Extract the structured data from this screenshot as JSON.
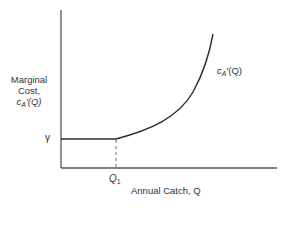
{
  "diagram": {
    "type": "marginal-cost-curve",
    "y_axis": {
      "label_line1": "Marginal",
      "label_line2": "Cost,",
      "label_fn": "c",
      "label_sub": "A",
      "label_rest": "'(Q)"
    },
    "x_axis": {
      "label": "Annual Catch, Q"
    },
    "gamma_label": "γ",
    "q1_label": "Q",
    "q1_sub": "1",
    "curve_label": {
      "fn": "c",
      "sub": "A",
      "rest": "'(Q)"
    },
    "colors": {
      "axis": "#555555",
      "curve": "#2a2a2a",
      "text": "#333333"
    }
  }
}
